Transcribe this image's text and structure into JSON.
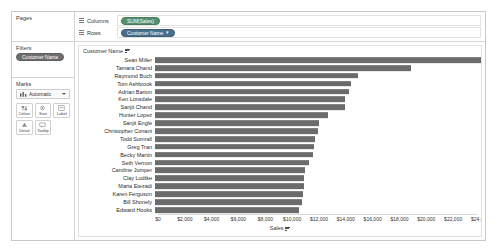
{
  "sidebar": {
    "pages": {
      "title": "Pages"
    },
    "filters": {
      "title": "Filters",
      "pills": [
        {
          "label": "Customer Name",
          "color": "#6e6e6e"
        }
      ]
    },
    "marks": {
      "title": "Marks",
      "type_label": "Automatic",
      "type_icon": "bar-mark-icon",
      "dropdown_icon": "chevron-down-icon",
      "buttons": [
        {
          "label": "Colour",
          "icon": "colour-icon"
        },
        {
          "label": "Size",
          "icon": "size-icon"
        },
        {
          "label": "Label",
          "icon": "label-icon"
        },
        {
          "label": "Detail",
          "icon": "detail-icon"
        },
        {
          "label": "Tooltip",
          "icon": "tooltip-icon"
        }
      ]
    }
  },
  "shelves": {
    "columns": {
      "label": "Columns",
      "grip_icon": "grip-icon",
      "pill": {
        "label": "SUM(Sales)",
        "type": "measure"
      }
    },
    "rows": {
      "label": "Rows",
      "grip_icon": "grip-icon",
      "pill": {
        "label": "Customer Name",
        "type": "dimension",
        "sort_icon": "sort-descending-icon"
      }
    }
  },
  "viz": {
    "row_field_header": "Customer Name",
    "row_field_sort_icon": "sort-descending-icon",
    "axis_title": "Sales",
    "axis_title_sort_icon": "sort-descending-icon",
    "bar_color": "#6b6b6b"
  },
  "chart_data": {
    "type": "bar",
    "title": "",
    "orientation": "horizontal",
    "xlabel": "Sales",
    "ylabel": "Customer Name",
    "xlim": [
      0,
      24000
    ],
    "grid": false,
    "legend": "none",
    "tick_labels": [
      "$0",
      "$2,000",
      "$4,000",
      "$6,000",
      "$8,000",
      "$10,000",
      "$12,000",
      "$14,000",
      "$16,000",
      "$18,000",
      "$20,000",
      "$22,000",
      "$24,000"
    ],
    "ticks": [
      0,
      2000,
      4000,
      6000,
      8000,
      10000,
      12000,
      14000,
      16000,
      18000,
      20000,
      22000,
      24000
    ],
    "categories": [
      "Sean Miller",
      "Tamara Chand",
      "Raymond Buch",
      "Tom Ashbrook",
      "Adrian Barton",
      "Ken Lonsdale",
      "Sanjit Chand",
      "Hunter Lopez",
      "Sanjit Engle",
      "Christopher Conant",
      "Todd Sumrall",
      "Greg Tran",
      "Becky Martin",
      "Seth Vernon",
      "Caroline Jumper",
      "Clay Ludtke",
      "Maria Etezadi",
      "Karen Ferguson",
      "Bill Shonely",
      "Edward Hooks"
    ],
    "values": [
      25043,
      19052,
      15117,
      14596,
      14474,
      14175,
      14142,
      12873,
      12209,
      12129,
      11891,
      11819,
      11772,
      11470,
      11164,
      11124,
      11078,
      11025,
      10928,
      10696
    ]
  }
}
